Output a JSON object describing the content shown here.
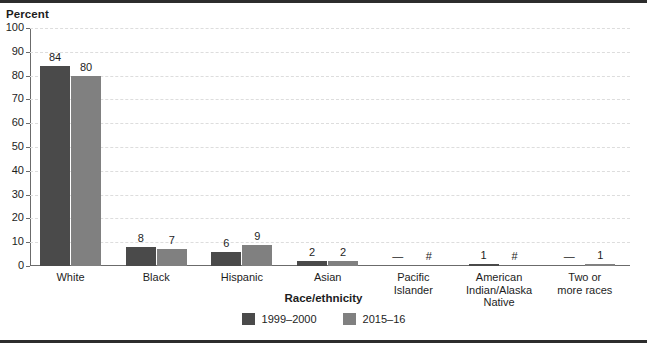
{
  "chart_data": {
    "type": "bar",
    "title": "",
    "xlabel": "Race/ethnicity",
    "ylabel": "Percent",
    "ylim": [
      0,
      100
    ],
    "yticks": [
      0,
      10,
      20,
      30,
      40,
      50,
      60,
      70,
      80,
      90,
      100
    ],
    "grid": true,
    "legend_position": "bottom",
    "categories": [
      "White",
      "Black",
      "Hispanic",
      "Asian",
      "Pacific Islander",
      "American Indian/Alaska Native",
      "Two or more races"
    ],
    "category_lines": [
      [
        "White"
      ],
      [
        "Black"
      ],
      [
        "Hispanic"
      ],
      [
        "Asian"
      ],
      [
        "Pacific",
        "Islander"
      ],
      [
        "American",
        "Indian/Alaska",
        "Native"
      ],
      [
        "Two or",
        "more races"
      ]
    ],
    "series": [
      {
        "name": "1999–2000",
        "color": "#4a4a4a",
        "values": [
          84,
          8,
          6,
          2,
          0,
          1,
          0
        ],
        "labels": [
          "84",
          "8",
          "6",
          "2",
          "—",
          "1",
          "—"
        ]
      },
      {
        "name": "2015–16",
        "color": "#808080",
        "values": [
          80,
          7,
          9,
          2,
          0,
          0,
          1
        ],
        "labels": [
          "80",
          "7",
          "9",
          "2",
          "#",
          "#",
          "1"
        ]
      }
    ]
  },
  "colors": {
    "series_1999_2000": "#4a4a4a",
    "series_2015_16": "#808080",
    "axis": "#6b6b6b",
    "grid": "#dddddd",
    "frame": "#2d2d2d",
    "text": "#1d1d1d",
    "background": "#ffffff"
  }
}
